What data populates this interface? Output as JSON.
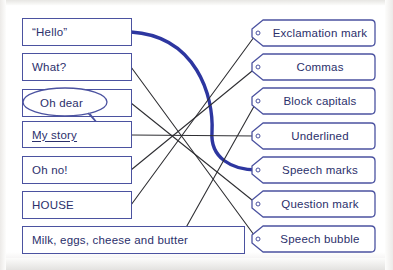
{
  "worksheet": {
    "title": "Matching punctuation worksheet",
    "left_items": [
      {
        "id": "hello",
        "label": "“Hello”",
        "style": "plain",
        "x": 22,
        "y": 18,
        "w": 110,
        "h": 28
      },
      {
        "id": "what",
        "label": "What?",
        "style": "plain",
        "x": 22,
        "y": 53,
        "w": 110,
        "h": 28
      },
      {
        "id": "ohdear",
        "label": "Oh dear",
        "style": "bubble",
        "x": 22,
        "y": 89,
        "w": 110,
        "h": 28
      },
      {
        "id": "mystory",
        "label": "My story",
        "style": "underline",
        "x": 22,
        "y": 121,
        "w": 110,
        "h": 27
      },
      {
        "id": "ohno",
        "label": "Oh no!",
        "style": "plain",
        "x": 22,
        "y": 156,
        "w": 110,
        "h": 28
      },
      {
        "id": "house",
        "label": "HOUSE",
        "style": "plain",
        "x": 22,
        "y": 191,
        "w": 110,
        "h": 28
      },
      {
        "id": "milk",
        "label": "Milk, eggs, cheese and butter",
        "style": "plain",
        "x": 22,
        "y": 226,
        "w": 223,
        "h": 28
      }
    ],
    "right_items": [
      {
        "id": "exclamation",
        "label": "Exclamation mark",
        "x": 250,
        "y": 19,
        "w": 126,
        "h": 28
      },
      {
        "id": "commas",
        "label": "Commas",
        "x": 250,
        "y": 53,
        "w": 126,
        "h": 28
      },
      {
        "id": "blockcaps",
        "label": "Block capitals",
        "x": 250,
        "y": 87,
        "w": 126,
        "h": 28
      },
      {
        "id": "underlined",
        "label": "Underlined",
        "x": 250,
        "y": 122,
        "w": 126,
        "h": 28
      },
      {
        "id": "speechmarks",
        "label": "Speech marks",
        "x": 250,
        "y": 156,
        "w": 126,
        "h": 28
      },
      {
        "id": "question",
        "label": "Question mark",
        "x": 250,
        "y": 190,
        "w": 126,
        "h": 28
      },
      {
        "id": "bubble",
        "label": "Speech bubble",
        "x": 250,
        "y": 225,
        "w": 126,
        "h": 28
      }
    ],
    "connections": [
      {
        "id": "c-hello-speechmarks",
        "from": "hello",
        "to": "speechmarks",
        "style": "thick-curve",
        "color": "#2d36a0",
        "path": "M 131 32 C 196 36, 214 96, 212 132 C 210 158, 232 170, 257 170"
      },
      {
        "id": "c-what-bubble",
        "from": "what",
        "to": "bubble",
        "style": "thin",
        "color": "#2f2f33",
        "path": "M 131 67 L 257 239"
      },
      {
        "id": "c-ohdear-question",
        "from": "ohdear",
        "to": "question",
        "style": "thin",
        "color": "#2f2f33",
        "path": "M 131 103 L 257 204"
      },
      {
        "id": "c-mystory-underlined",
        "from": "mystory",
        "to": "underlined",
        "style": "thin",
        "color": "#2f2f33",
        "path": "M 131 135 L 257 136"
      },
      {
        "id": "c-ohno-commas",
        "from": "ohno",
        "to": "commas",
        "style": "thin",
        "color": "#2f2f33",
        "path": "M 131 170 L 257 67"
      },
      {
        "id": "c-house-exclamation",
        "from": "house",
        "to": "exclamation",
        "style": "thin",
        "color": "#2f2f33",
        "path": "M 131 205 L 257 33"
      },
      {
        "id": "c-milk-blockcaps",
        "from": "milk",
        "to": "blockcaps",
        "style": "thin",
        "color": "#2f2f33",
        "path": "M 179 240 L 257 101"
      }
    ],
    "colors": {
      "box_border": "#4b52a0",
      "text": "#2b2f6b",
      "thick_line": "#2d36a0",
      "thin_line": "#2f2f33",
      "paper": "#ffffff"
    }
  }
}
